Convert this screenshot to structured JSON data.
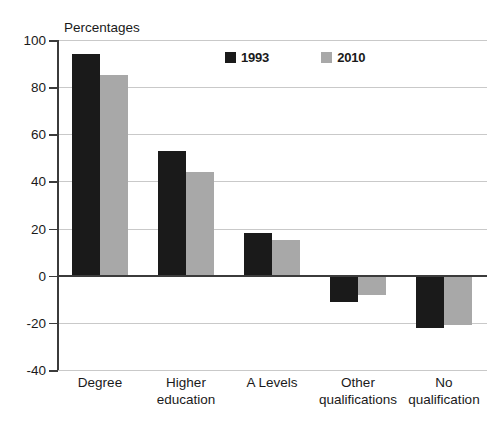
{
  "chart_data": {
    "type": "bar",
    "title": "",
    "subtitle": "",
    "axis_title": "Percentages",
    "xlabel": "",
    "ylabel": "Percentages",
    "ylim": [
      -40,
      100
    ],
    "ytick_step": 20,
    "yticks": [
      100,
      80,
      60,
      40,
      20,
      0,
      -20,
      -40
    ],
    "ytick_labels": [
      "100",
      "80",
      "60",
      "40",
      "20",
      "0",
      "-20",
      "-40"
    ],
    "grid": true,
    "grid_axis": "y",
    "legend_position": "top-right-inside",
    "categories": [
      "Degree",
      "Higher education",
      "A Levels",
      "Other qualifications",
      "No qualification"
    ],
    "category_lines": [
      [
        "Degree"
      ],
      [
        "Higher",
        "education"
      ],
      [
        "A Levels"
      ],
      [
        "Other",
        "qualifications"
      ],
      [
        "No",
        "qualification"
      ]
    ],
    "series": [
      {
        "name": "1993",
        "color": "#1a1a1a",
        "values": [
          94,
          53,
          18,
          -11,
          -22
        ]
      },
      {
        "name": "2010",
        "color": "#a8a8a8",
        "values": [
          85,
          44,
          15,
          -8,
          -21
        ]
      }
    ]
  },
  "legend": {
    "items": [
      {
        "label": "1993",
        "color": "#1a1a1a"
      },
      {
        "label": "2010",
        "color": "#a8a8a8"
      }
    ]
  },
  "colors": {
    "series_1993": "#1a1a1a",
    "series_2010": "#a8a8a8",
    "gridline": "#c9c9c9",
    "axis": "#3b3b3b",
    "background": "#ffffff",
    "text": "#1a1a1a"
  }
}
